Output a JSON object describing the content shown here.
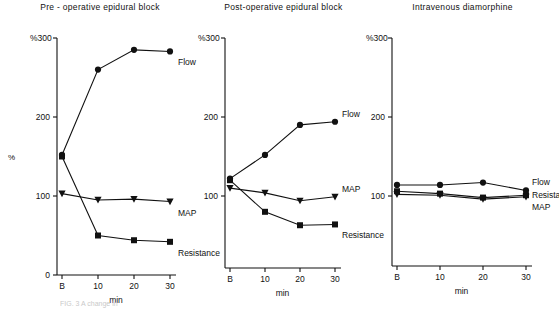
{
  "figure": {
    "y_axis_unit": "%",
    "y_axis_corner_label": "%300",
    "x_axis_label": "min",
    "left_unit_label": "%",
    "caption_fragment": "FIG. 3 A change in"
  },
  "chart_data": [
    {
      "type": "line",
      "title": "Pre - operative epidural block",
      "xlabel": "min",
      "ylabel": "%",
      "x": [
        "B",
        "10",
        "20",
        "30"
      ],
      "x_values": [
        0,
        10,
        20,
        30
      ],
      "ylim": [
        0,
        300
      ],
      "yticks": [
        0,
        100,
        200,
        300
      ],
      "ytick_labels": [
        "0",
        "100",
        "200",
        "300"
      ],
      "grid": false,
      "legend": "inline-right",
      "series": [
        {
          "name": "Flow",
          "marker": "circle",
          "values": [
            152,
            260,
            285,
            283
          ]
        },
        {
          "name": "MAP",
          "marker": "triangle-down",
          "values": [
            103,
            95,
            96,
            93
          ]
        },
        {
          "name": "Resistance",
          "marker": "square",
          "values": [
            150,
            50,
            44,
            42
          ]
        }
      ]
    },
    {
      "type": "line",
      "title": "Post-operative epidural block",
      "xlabel": "min",
      "ylabel": "%",
      "x": [
        "B",
        "10",
        "20",
        "30"
      ],
      "x_values": [
        0,
        10,
        20,
        30
      ],
      "ylim": [
        0,
        300
      ],
      "yticks": [
        100,
        200,
        300
      ],
      "ytick_labels": [
        "100",
        "200",
        "300"
      ],
      "grid": false,
      "legend": "inline-right",
      "series": [
        {
          "name": "Flow",
          "marker": "circle",
          "values": [
            122,
            152,
            190,
            194
          ]
        },
        {
          "name": "MAP",
          "marker": "triangle-down",
          "values": [
            110,
            104,
            94,
            99
          ]
        },
        {
          "name": "Resistance",
          "marker": "square",
          "values": [
            120,
            80,
            63,
            64
          ]
        }
      ]
    },
    {
      "type": "line",
      "title": "Intravenous diamorphine",
      "xlabel": "min",
      "ylabel": "%",
      "x": [
        "B",
        "10",
        "20",
        "30"
      ],
      "x_values": [
        0,
        10,
        20,
        30
      ],
      "ylim": [
        0,
        300
      ],
      "yticks": [
        100,
        200,
        300
      ],
      "ytick_labels": [
        "100",
        "200",
        "300"
      ],
      "grid": false,
      "legend": "inline-right",
      "series": [
        {
          "name": "Flow",
          "marker": "circle",
          "values": [
            114,
            114,
            117,
            107
          ]
        },
        {
          "name": "Resistance",
          "marker": "square",
          "values": [
            106,
            103,
            98,
            101
          ]
        },
        {
          "name": "MAP",
          "marker": "triangle-down",
          "values": [
            102,
            101,
            96,
            99
          ]
        }
      ]
    }
  ]
}
